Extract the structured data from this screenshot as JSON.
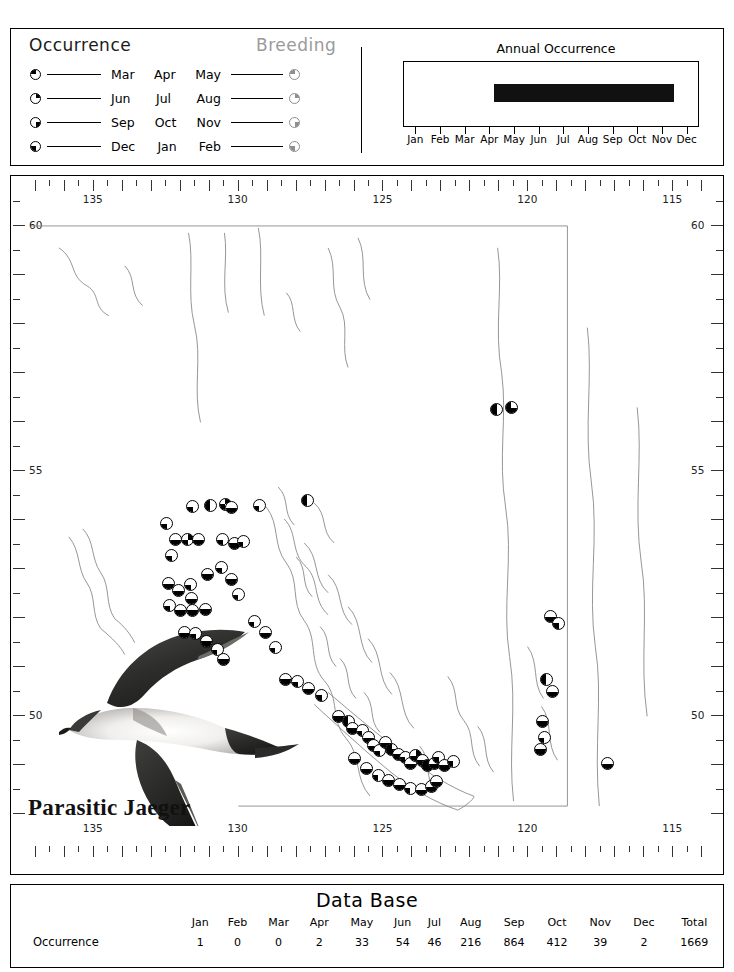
{
  "legend": {
    "occurrence_title": "Occurrence",
    "breeding_title": "Breeding",
    "rows": [
      {
        "months": [
          "Mar",
          "Apr",
          "May"
        ],
        "occ_symbol": "quarter-pie-tl",
        "brd_symbol": "quarter-pie-tl-gray"
      },
      {
        "months": [
          "Jun",
          "Jul",
          "Aug"
        ],
        "occ_symbol": "quarter-pie-tr",
        "brd_symbol": "quarter-pie-tr-gray"
      },
      {
        "months": [
          "Sep",
          "Oct",
          "Nov"
        ],
        "occ_symbol": "quarter-pie-br",
        "brd_symbol": "quarter-pie-br-gray"
      },
      {
        "months": [
          "Dec",
          "Jan",
          "Feb"
        ],
        "occ_symbol": "quarter-pie-bl",
        "brd_symbol": "quarter-pie-bl-gray"
      }
    ]
  },
  "annual": {
    "title": "Annual Occurrence",
    "months": [
      "Jan",
      "Feb",
      "Mar",
      "Apr",
      "May",
      "Jun",
      "Jul",
      "Aug",
      "Sep",
      "Oct",
      "Nov",
      "Dec"
    ],
    "bar_start_month": 4.15,
    "bar_end_month": 11.45
  },
  "map": {
    "species": "Parasitic Jaeger",
    "lon_labels": [
      "135",
      "130",
      "125",
      "120",
      "115"
    ],
    "lon_values": [
      135,
      130,
      125,
      120,
      115
    ],
    "lat_labels": [
      "60",
      "55",
      "50"
    ],
    "lat_values": [
      60,
      55,
      50
    ]
  },
  "database": {
    "title": "Data Base",
    "columns": [
      "Jan",
      "Feb",
      "Mar",
      "Apr",
      "May",
      "Jun",
      "Jul",
      "Aug",
      "Sep",
      "Oct",
      "Nov",
      "Dec",
      "Total"
    ],
    "rows": [
      {
        "label": "Occurrence",
        "values": [
          "1",
          "0",
          "0",
          "2",
          "33",
          "54",
          "46",
          "216",
          "864",
          "412",
          "39",
          "2",
          "1669"
        ]
      }
    ]
  },
  "chart_data": {
    "type": "bar",
    "title": "Annual Occurrence",
    "categories": [
      "Jan",
      "Feb",
      "Mar",
      "Apr",
      "May",
      "Jun",
      "Jul",
      "Aug",
      "Sep",
      "Oct",
      "Nov",
      "Dec"
    ],
    "values": [
      1,
      0,
      0,
      2,
      33,
      54,
      46,
      216,
      864,
      412,
      39,
      2
    ],
    "xlabel": "",
    "ylabel": "",
    "grid": false,
    "legend_position": "none"
  },
  "markers": [
    {
      "lon": 131.55,
      "lat": 54.3,
      "q": "bl"
    },
    {
      "lon": 130.95,
      "lat": 54.32,
      "q": "tl,bl"
    },
    {
      "lon": 130.42,
      "lat": 54.35,
      "q": "bl,tr"
    },
    {
      "lon": 130.2,
      "lat": 54.28,
      "q": "bl,br"
    },
    {
      "lon": 129.25,
      "lat": 54.32,
      "q": "bl"
    },
    {
      "lon": 127.6,
      "lat": 54.42,
      "q": "bl,tl"
    },
    {
      "lon": 132.45,
      "lat": 53.95,
      "q": "bl"
    },
    {
      "lon": 132.15,
      "lat": 53.62,
      "q": "bl,br"
    },
    {
      "lon": 131.72,
      "lat": 53.62,
      "q": "bl,tr"
    },
    {
      "lon": 131.35,
      "lat": 53.62,
      "q": "bl,br"
    },
    {
      "lon": 132.28,
      "lat": 53.3,
      "q": "bl"
    },
    {
      "lon": 130.52,
      "lat": 53.62,
      "q": "bl"
    },
    {
      "lon": 130.1,
      "lat": 53.55,
      "q": "bl,br"
    },
    {
      "lon": 129.8,
      "lat": 53.58,
      "q": "bl"
    },
    {
      "lon": 130.55,
      "lat": 53.05,
      "q": "bl"
    },
    {
      "lon": 131.05,
      "lat": 52.92,
      "q": "bl,br"
    },
    {
      "lon": 132.4,
      "lat": 52.72,
      "q": "bl,br"
    },
    {
      "lon": 132.05,
      "lat": 52.58,
      "q": "bl,br"
    },
    {
      "lon": 131.62,
      "lat": 52.7,
      "q": "bl"
    },
    {
      "lon": 131.6,
      "lat": 52.42,
      "q": "bl,br"
    },
    {
      "lon": 132.35,
      "lat": 52.28,
      "q": "bl"
    },
    {
      "lon": 131.98,
      "lat": 52.18,
      "q": "bl,br"
    },
    {
      "lon": 131.55,
      "lat": 52.18,
      "q": "bl,br"
    },
    {
      "lon": 131.12,
      "lat": 52.2,
      "q": "bl,br"
    },
    {
      "lon": 130.22,
      "lat": 52.82,
      "q": "bl,br"
    },
    {
      "lon": 129.98,
      "lat": 52.5,
      "q": "bl"
    },
    {
      "lon": 131.82,
      "lat": 51.72,
      "q": "bl,br"
    },
    {
      "lon": 131.45,
      "lat": 51.7,
      "q": "bl"
    },
    {
      "lon": 131.08,
      "lat": 51.55,
      "q": "bl,br"
    },
    {
      "lon": 130.7,
      "lat": 51.38,
      "q": "bl"
    },
    {
      "lon": 130.48,
      "lat": 51.18,
      "q": "bl,br"
    },
    {
      "lon": 129.42,
      "lat": 51.95,
      "q": "bl"
    },
    {
      "lon": 129.05,
      "lat": 51.72,
      "q": "bl,br"
    },
    {
      "lon": 128.7,
      "lat": 51.42,
      "q": "bl"
    },
    {
      "lon": 128.35,
      "lat": 50.78,
      "q": "bl,br"
    },
    {
      "lon": 127.92,
      "lat": 50.72,
      "q": "bl"
    },
    {
      "lon": 127.55,
      "lat": 50.58,
      "q": "bl,br"
    },
    {
      "lon": 127.1,
      "lat": 50.45,
      "q": "bl"
    },
    {
      "lon": 126.52,
      "lat": 50.02,
      "q": "bl,br"
    },
    {
      "lon": 126.18,
      "lat": 49.92,
      "q": "bl,tl"
    },
    {
      "lon": 126.05,
      "lat": 49.78,
      "q": "bl,br"
    },
    {
      "lon": 125.7,
      "lat": 49.72,
      "q": "bl"
    },
    {
      "lon": 125.48,
      "lat": 49.58,
      "q": "bl,br"
    },
    {
      "lon": 125.3,
      "lat": 49.42,
      "q": "bl,br"
    },
    {
      "lon": 125.1,
      "lat": 49.32,
      "q": "bl"
    },
    {
      "lon": 124.88,
      "lat": 49.48,
      "q": "bl,br"
    },
    {
      "lon": 124.68,
      "lat": 49.35,
      "q": "bl,br,tl"
    },
    {
      "lon": 124.45,
      "lat": 49.25,
      "q": "bl,br"
    },
    {
      "lon": 124.22,
      "lat": 49.18,
      "q": "bl"
    },
    {
      "lon": 124.05,
      "lat": 49.05,
      "q": "bl,br"
    },
    {
      "lon": 123.85,
      "lat": 49.22,
      "q": "bl,br,tr"
    },
    {
      "lon": 123.62,
      "lat": 49.12,
      "q": "bl,br"
    },
    {
      "lon": 123.45,
      "lat": 49.02,
      "q": "bl,br,tl,tr"
    },
    {
      "lon": 123.22,
      "lat": 49.05,
      "q": "bl,br"
    },
    {
      "lon": 123.05,
      "lat": 49.18,
      "q": "bl"
    },
    {
      "lon": 125.95,
      "lat": 49.15,
      "q": "bl,br"
    },
    {
      "lon": 125.55,
      "lat": 48.95,
      "q": "bl,br"
    },
    {
      "lon": 125.15,
      "lat": 48.82,
      "q": "bl"
    },
    {
      "lon": 124.8,
      "lat": 48.72,
      "q": "bl,br"
    },
    {
      "lon": 124.42,
      "lat": 48.62,
      "q": "bl,br"
    },
    {
      "lon": 124.05,
      "lat": 48.55,
      "q": "bl"
    },
    {
      "lon": 123.65,
      "lat": 48.52,
      "q": "bl,br"
    },
    {
      "lon": 123.32,
      "lat": 48.58,
      "q": "bl,br"
    },
    {
      "lon": 123.12,
      "lat": 48.68,
      "q": "bl,br"
    },
    {
      "lon": 122.85,
      "lat": 49.02,
      "q": "bl,br"
    },
    {
      "lon": 122.55,
      "lat": 49.1,
      "q": "bl"
    },
    {
      "lon": 121.05,
      "lat": 56.28,
      "q": "bl,tl"
    },
    {
      "lon": 120.55,
      "lat": 56.32,
      "q": "bl,br,tl"
    },
    {
      "lon": 119.2,
      "lat": 52.05,
      "q": "bl,br"
    },
    {
      "lon": 118.92,
      "lat": 51.92,
      "q": "bl"
    },
    {
      "lon": 119.35,
      "lat": 50.78,
      "q": "bl,tl"
    },
    {
      "lon": 119.12,
      "lat": 50.52,
      "q": "bl,br"
    },
    {
      "lon": 119.48,
      "lat": 49.92,
      "q": "bl,br"
    },
    {
      "lon": 119.42,
      "lat": 49.58,
      "q": "bl"
    },
    {
      "lon": 119.55,
      "lat": 49.35,
      "q": "bl,br"
    },
    {
      "lon": 117.25,
      "lat": 49.05,
      "q": "bl,br"
    }
  ]
}
